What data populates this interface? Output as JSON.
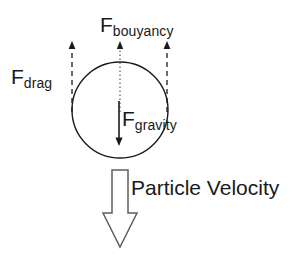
{
  "diagram": {
    "background_color": "#ffffff",
    "stroke_color": "#1a1a1a",
    "particle": {
      "name": "particle-circle",
      "shape": "circle",
      "center_x": 120,
      "center_y": 110,
      "radius": 48
    },
    "labels": {
      "bouyancy": {
        "base": "F",
        "subscript": "bouyancy"
      },
      "drag": {
        "base": "F",
        "subscript": "drag"
      },
      "gravity": {
        "base": "F",
        "subscript": "gravity"
      },
      "velocity": "Particle Velocity"
    },
    "vectors": [
      {
        "name": "drag-arrow-left",
        "label_ref": "drag",
        "direction": "up",
        "line_style": "dashed",
        "x": 72,
        "y_start": 110,
        "y_end": 44
      },
      {
        "name": "drag-arrow-right",
        "label_ref": "drag",
        "direction": "up",
        "line_style": "dashed",
        "x": 167,
        "y_start": 110,
        "y_end": 44
      },
      {
        "name": "bouyancy-arrow",
        "label_ref": "bouyancy",
        "direction": "up",
        "line_style": "dotted",
        "x": 120,
        "y_start": 110,
        "y_end": 44
      },
      {
        "name": "gravity-arrow",
        "label_ref": "gravity",
        "direction": "down",
        "line_style": "solid",
        "x": 119,
        "y_start": 101,
        "y_end": 145
      },
      {
        "name": "particle-velocity-arrow",
        "label_ref": "velocity",
        "direction": "down",
        "line_style": "block-outline",
        "x": 120,
        "y_start": 170,
        "y_end": 247
      }
    ]
  }
}
